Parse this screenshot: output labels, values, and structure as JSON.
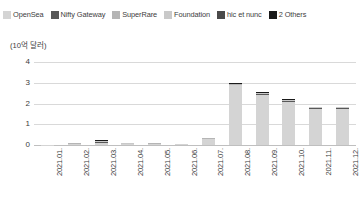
{
  "legend": {
    "position": "top",
    "items": [
      {
        "label": "OpenSea",
        "color": "#d4d4d4"
      },
      {
        "label": "Nifty Gateway",
        "color": "#585858"
      },
      {
        "label": "SuperRare",
        "color": "#b5b5b5"
      },
      {
        "label": "Foundation",
        "color": "#c9c9c9"
      },
      {
        "label": "hic et nunc",
        "color": "#4a4a4a"
      },
      {
        "label": "2 Others",
        "color": "#1a1a1a"
      }
    ]
  },
  "axes": {
    "unit_caption": "(10억 달러)",
    "y_ticks": [
      "4",
      "3",
      "2",
      "1",
      "0"
    ],
    "x_ticks": [
      "2021.01.",
      "2021.02.",
      "2021.03.",
      "2021.04.",
      "2021.05.",
      "2021.06.",
      "2021.07.",
      "2021.08.",
      "2021.09.",
      "2021.10.",
      "2021.11.",
      "2021.12."
    ]
  },
  "chart_data": {
    "type": "bar",
    "stacked": true,
    "title": "",
    "subtitle": "",
    "xlabel": "",
    "ylabel": "(10억 달러)",
    "ylim": [
      0,
      4
    ],
    "yticks": [
      0,
      1,
      2,
      3,
      4
    ],
    "grid": true,
    "legend_position": "top",
    "categories": [
      "2021.01.",
      "2021.02.",
      "2021.03.",
      "2021.04.",
      "2021.05.",
      "2021.06.",
      "2021.07.",
      "2021.08.",
      "2021.09.",
      "2021.10.",
      "2021.11.",
      "2021.12."
    ],
    "series": [
      {
        "name": "OpenSea",
        "color": "#d4d4d4",
        "values": [
          0.005,
          0.04,
          0.08,
          0.03,
          0.05,
          0.03,
          0.3,
          2.88,
          2.42,
          2.09,
          1.74,
          1.75
        ]
      },
      {
        "name": "Nifty Gateway",
        "color": "#585858",
        "values": [
          0.004,
          0.03,
          0.05,
          0.02,
          0.02,
          0.01,
          0.01,
          0.03,
          0.03,
          0.03,
          0.03,
          0.03
        ]
      },
      {
        "name": "SuperRare",
        "color": "#b5b5b5",
        "values": [
          0.003,
          0.02,
          0.03,
          0.02,
          0.01,
          0.005,
          0.005,
          0.02,
          0.02,
          0.02,
          0.02,
          0.02
        ]
      },
      {
        "name": "Foundation",
        "color": "#c9c9c9",
        "values": [
          0.002,
          0.01,
          0.03,
          0.01,
          0.01,
          0.005,
          0.005,
          0.01,
          0.02,
          0.02,
          0.02,
          0.02
        ]
      },
      {
        "name": "hic et nunc",
        "color": "#4a4a4a",
        "values": [
          0.003,
          0.01,
          0.02,
          0.01,
          0.005,
          0.003,
          0.003,
          0.02,
          0.03,
          0.02,
          0.02,
          0.02
        ]
      },
      {
        "name": "2 Others",
        "color": "#1a1a1a",
        "values": [
          0.003,
          0.01,
          0.01,
          0.005,
          0.005,
          0.002,
          0.002,
          0.02,
          0.03,
          0.02,
          0.02,
          0.01
        ]
      }
    ],
    "totals": [
      0.02,
      0.12,
      0.22,
      0.09,
      0.1,
      0.05,
      0.32,
      2.98,
      2.55,
      2.2,
      1.85,
      1.85
    ]
  }
}
